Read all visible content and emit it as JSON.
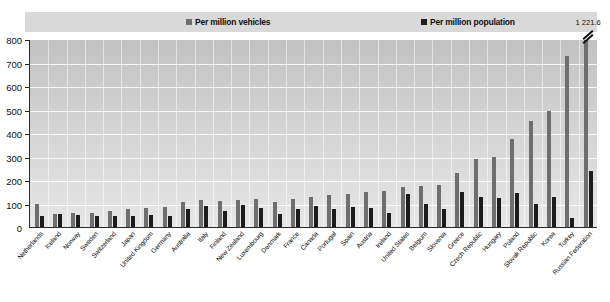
{
  "legend": {
    "series": [
      {
        "label": "Per million vehicles",
        "color": "#6e6e6e",
        "key": "vehicles"
      },
      {
        "label": "Per million population",
        "color": "#1c1c1c",
        "key": "population"
      }
    ]
  },
  "axis": {
    "y_ticks": [
      "800",
      "700",
      "600",
      "500",
      "400",
      "300",
      "200",
      "100",
      "0"
    ]
  },
  "annotation": {
    "broken_bar_value_label": "1 221.6",
    "broken_bar_category": "Russian Federation"
  },
  "chart_data": {
    "type": "bar",
    "title": "",
    "xlabel": "",
    "ylabel": "",
    "ylim": [
      0,
      800
    ],
    "grid": true,
    "legend_position": "top",
    "categories": [
      "Netherlands",
      "Iceland",
      "Norway",
      "Sweden",
      "Switzerland",
      "Japan",
      "United Kingdom",
      "Germany",
      "Australia",
      "Italy",
      "Finland",
      "New Zealand",
      "Luxembourg",
      "Denmark",
      "France",
      "Canada",
      "Portugal",
      "Spain",
      "Austria",
      "Ireland",
      "United States",
      "Belgium",
      "Slovenia",
      "Greece",
      "Czech Republic",
      "Hungary",
      "Poland",
      "Slovak Republic",
      "Korea",
      "Turkey",
      "Russian Federation"
    ],
    "series": [
      {
        "name": "Per million vehicles",
        "color": "#6e6e6e",
        "values": [
          100,
          55,
          62,
          60,
          70,
          75,
          80,
          86,
          105,
          115,
          110,
          116,
          120,
          106,
          120,
          130,
          135,
          140,
          150,
          155,
          170,
          175,
          180,
          230,
          290,
          300,
          375,
          455,
          495,
          730,
          1221.6
        ]
      },
      {
        "name": "Per million population",
        "color": "#1c1c1c",
        "values": [
          45,
          55,
          50,
          48,
          45,
          45,
          50,
          48,
          78,
          90,
          70,
          95,
          80,
          55,
          75,
          90,
          78,
          85,
          82,
          60,
          140,
          100,
          75,
          150,
          130,
          125,
          145,
          100,
          130,
          38,
          240
        ]
      }
    ],
    "notes": [
      {
        "category": "Russian Federation",
        "series": "Per million vehicles",
        "label": "1 221.6",
        "clipped": true
      }
    ]
  }
}
